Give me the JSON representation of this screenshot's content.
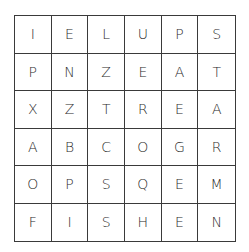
{
  "puzzle": {
    "type": "word-search",
    "rows": 6,
    "cols": 6,
    "grid": [
      [
        "I",
        "E",
        "L",
        "U",
        "P",
        "S"
      ],
      [
        "P",
        "N",
        "Z",
        "E",
        "A",
        "T"
      ],
      [
        "X",
        "Z",
        "T",
        "R",
        "E",
        "A"
      ],
      [
        "A",
        "B",
        "C",
        "O",
        "G",
        "R"
      ],
      [
        "O",
        "P",
        "S",
        "Q",
        "E",
        "M"
      ],
      [
        "F",
        "I",
        "S",
        "H",
        "E",
        "N"
      ]
    ]
  }
}
